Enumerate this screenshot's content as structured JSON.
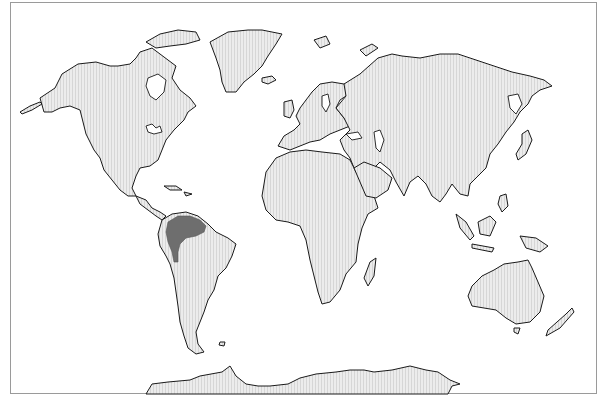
{
  "map": {
    "type": "world-distribution-map",
    "projection": "world outline",
    "colors": {
      "background": "#ffffff",
      "land_fill": "#ececec",
      "land_hatch": "#d8d8d8",
      "coastline": "#1a1a1a",
      "highlight_range": "#6e6e6e",
      "frame_border": "#9a9a9a"
    },
    "regions": [
      {
        "name": "North America",
        "highlighted": false
      },
      {
        "name": "Greenland",
        "highlighted": false
      },
      {
        "name": "South America",
        "highlighted": false
      },
      {
        "name": "Europe",
        "highlighted": false
      },
      {
        "name": "Africa",
        "highlighted": false
      },
      {
        "name": "Asia",
        "highlighted": false
      },
      {
        "name": "Australia",
        "highlighted": false
      },
      {
        "name": "Antarctica",
        "highlighted": false
      }
    ],
    "highlighted_area": {
      "description": "Northern South America (Amazon basin)",
      "color": "#6e6e6e"
    }
  }
}
